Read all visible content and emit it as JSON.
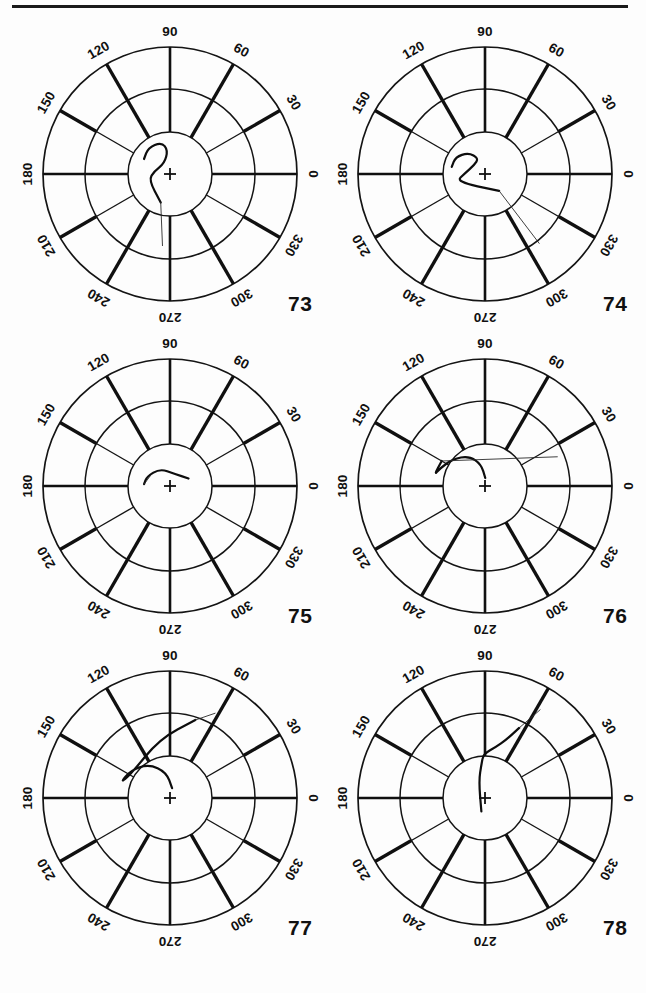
{
  "page": {
    "background_color": "#fdfdfd",
    "ink_color": "#101010",
    "has_top_rule": true
  },
  "geometry": {
    "outer_radius": 127,
    "middle_radius": 85,
    "inner_radius": 42,
    "center_x": 160,
    "center_y": 150,
    "tick_label_radius": 143
  },
  "tick_labels": [
    "0",
    "30",
    "60",
    "90",
    "120",
    "150",
    "180",
    "210",
    "240",
    "270",
    "300",
    "330"
  ],
  "tick_angles": [
    0,
    30,
    60,
    90,
    120,
    150,
    180,
    210,
    240,
    270,
    300,
    330
  ],
  "chart_data": {
    "type": "scatter",
    "title": "",
    "xlabel": "",
    "ylabel": "",
    "grid": true,
    "legend_position": "none",
    "coordinate_system": "polar",
    "angular_unit": "degrees",
    "angular_ticks": [
      0,
      30,
      60,
      90,
      120,
      150,
      180,
      210,
      240,
      270,
      300,
      330
    ],
    "radial_rings": [
      42,
      85,
      127
    ],
    "panels": [
      {
        "label": "73",
        "trace_description": "small closed blob near center with thin tail trailing to 270 degrees",
        "points_polar": [
          {
            "angle": 150,
            "r": 30
          },
          {
            "angle": 130,
            "r": 34
          },
          {
            "angle": 105,
            "r": 33
          },
          {
            "angle": 95,
            "r": 24
          },
          {
            "angle": 118,
            "r": 12
          },
          {
            "angle": 170,
            "r": 16
          },
          {
            "angle": 196,
            "r": 22
          },
          {
            "angle": 252,
            "r": 30
          },
          {
            "angle": 264,
            "r": 72
          }
        ]
      },
      {
        "label": "74",
        "trace_description": "hook shape at upper left of center with long thin ray toward 305 degrees",
        "points_polar": [
          {
            "angle": 168,
            "r": 34
          },
          {
            "angle": 150,
            "r": 34
          },
          {
            "angle": 128,
            "r": 27
          },
          {
            "angle": 112,
            "r": 17
          },
          {
            "angle": 140,
            "r": 14
          },
          {
            "angle": 178,
            "r": 20
          },
          {
            "angle": 195,
            "r": 30
          },
          {
            "angle": 310,
            "r": 22
          },
          {
            "angle": 308,
            "r": 88
          }
        ]
      },
      {
        "label": "75",
        "trace_description": "small arrow-like mark just above center pointing toward 180 degrees",
        "points_polar": [
          {
            "angle": 22,
            "r": 20
          },
          {
            "angle": 70,
            "r": 13
          },
          {
            "angle": 120,
            "r": 20
          },
          {
            "angle": 158,
            "r": 25
          },
          {
            "angle": 176,
            "r": 26
          },
          {
            "angle": 150,
            "r": 22
          }
        ]
      },
      {
        "label": "76",
        "trace_description": "curve sweeping from center up and left to 160 degrees at mid radius with faint horizontal dotted line to the right",
        "points_polar": [
          {
            "angle": 88,
            "r": 8
          },
          {
            "angle": 100,
            "r": 22
          },
          {
            "angle": 118,
            "r": 34
          },
          {
            "angle": 140,
            "r": 42
          },
          {
            "angle": 158,
            "r": 48
          },
          {
            "angle": 168,
            "r": 52
          },
          {
            "angle": 150,
            "r": 50
          },
          {
            "angle": 22,
            "r": 78
          }
        ]
      },
      {
        "label": "77",
        "trace_description": "curve from center up-left forming a hook, then thin ray out to 65 degrees at two-thirds radius",
        "points_polar": [
          {
            "angle": 78,
            "r": 10
          },
          {
            "angle": 98,
            "r": 26
          },
          {
            "angle": 122,
            "r": 40
          },
          {
            "angle": 145,
            "r": 48
          },
          {
            "angle": 163,
            "r": 52
          },
          {
            "angle": 150,
            "r": 46
          },
          {
            "angle": 100,
            "r": 60
          },
          {
            "angle": 72,
            "r": 82
          },
          {
            "angle": 62,
            "r": 96
          }
        ]
      },
      {
        "label": "78",
        "trace_description": "wiggling trace from center upward then out toward 58 degrees past the middle ring",
        "points_polar": [
          {
            "angle": 255,
            "r": 14
          },
          {
            "angle": 110,
            "r": 18
          },
          {
            "angle": 96,
            "r": 34
          },
          {
            "angle": 92,
            "r": 44
          },
          {
            "angle": 78,
            "r": 52
          },
          {
            "angle": 70,
            "r": 62
          },
          {
            "angle": 64,
            "r": 78
          },
          {
            "angle": 58,
            "r": 104
          }
        ]
      }
    ]
  },
  "panels": [
    {
      "id": "p73",
      "label": "73",
      "left": 10,
      "top": 24
    },
    {
      "id": "p74",
      "label": "74",
      "left": 325,
      "top": 24
    },
    {
      "id": "p75",
      "label": "75",
      "left": 10,
      "top": 336
    },
    {
      "id": "p76",
      "label": "76",
      "left": 325,
      "top": 336
    },
    {
      "id": "p77",
      "label": "77",
      "left": 10,
      "top": 648
    },
    {
      "id": "p78",
      "label": "78",
      "left": 325,
      "top": 648
    }
  ]
}
